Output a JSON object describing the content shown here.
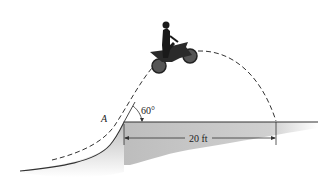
{
  "diagram": {
    "type": "projectile-motion-figure",
    "labels": {
      "point": "A",
      "angle": "60°",
      "distance": "20 ft"
    },
    "colors": {
      "ground_shade": "#c8c8c8",
      "line": "#333333",
      "rider": "#1a1a1a"
    }
  }
}
